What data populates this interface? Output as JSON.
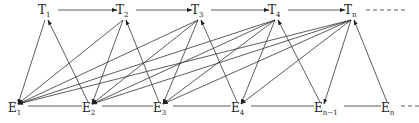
{
  "diagram": {
    "type": "directed-graph",
    "colors": {
      "stroke": "#333333",
      "text": "#222222",
      "background": "#ffffff"
    },
    "top_row": [
      {
        "id": "T1",
        "base": "T",
        "sub": "1",
        "x": 42,
        "y": 12
      },
      {
        "id": "T2",
        "base": "T",
        "sub": "2",
        "x": 120,
        "y": 12
      },
      {
        "id": "T3",
        "base": "T",
        "sub": "3",
        "x": 195,
        "y": 12
      },
      {
        "id": "T4",
        "base": "T",
        "sub": "4",
        "x": 272,
        "y": 12
      },
      {
        "id": "Tn",
        "base": "T",
        "sub": "n",
        "x": 348,
        "y": 12
      }
    ],
    "bottom_row": [
      {
        "id": "E1",
        "base": "E",
        "sub": "1",
        "x": 12,
        "y": 110
      },
      {
        "id": "E2",
        "base": "E",
        "sub": "2",
        "x": 86,
        "y": 110
      },
      {
        "id": "E3",
        "base": "E",
        "sub": "3",
        "x": 157,
        "y": 110
      },
      {
        "id": "E4",
        "base": "E",
        "sub": "4",
        "x": 235,
        "y": 110
      },
      {
        "id": "En-1",
        "base": "E",
        "sub": "n−1",
        "x": 318,
        "y": 110
      },
      {
        "id": "En",
        "base": "E",
        "sub": "n",
        "x": 385,
        "y": 110
      }
    ],
    "top_chain_arrows": [
      [
        "T1",
        "T2"
      ],
      [
        "T2",
        "T3"
      ],
      [
        "T3",
        "T4"
      ],
      [
        "T4",
        "Tn"
      ]
    ],
    "bottom_chain_lines": [
      [
        "E1",
        "E2"
      ],
      [
        "E2",
        "E3"
      ],
      [
        "E3",
        "E4"
      ],
      [
        "E4",
        "En-1"
      ],
      [
        "En-1",
        "En"
      ]
    ],
    "upward_arrows": [
      [
        "E2",
        "T1"
      ],
      [
        "E3",
        "T2"
      ],
      [
        "E4",
        "T3"
      ],
      [
        "En-1",
        "T4"
      ],
      [
        "En",
        "Tn"
      ]
    ],
    "downward_arrows": [
      [
        "T1",
        "E1"
      ],
      [
        "T2",
        "E1"
      ],
      [
        "T2",
        "E2"
      ],
      [
        "T3",
        "E1"
      ],
      [
        "T3",
        "E2"
      ],
      [
        "T3",
        "E3"
      ],
      [
        "T4",
        "E1"
      ],
      [
        "T4",
        "E2"
      ],
      [
        "T4",
        "E3"
      ],
      [
        "T4",
        "E4"
      ],
      [
        "Tn",
        "E1"
      ],
      [
        "Tn",
        "E2"
      ],
      [
        "Tn",
        "E3"
      ],
      [
        "Tn",
        "E4"
      ],
      [
        "Tn",
        "En-1"
      ]
    ],
    "continuation": {
      "top": "dashed after Tn",
      "bottom": "dashed after En"
    }
  }
}
